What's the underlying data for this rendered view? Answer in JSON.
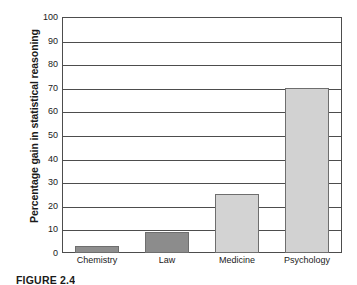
{
  "figure": {
    "caption": "FIGURE 2.4"
  },
  "chart_data": {
    "type": "bar",
    "title": "",
    "xlabel": "",
    "ylabel": "Percentage gain in statistical reasoning",
    "categories": [
      "Chemistry",
      "Law",
      "Medicine",
      "Psychology"
    ],
    "values": [
      3,
      9,
      25,
      70
    ],
    "series": [
      {
        "name": "Percentage gain in statistical reasoning",
        "values": [
          3,
          9,
          25,
          70
        ]
      }
    ],
    "ylim": [
      0,
      100
    ],
    "ytick_labels": [
      "100",
      "90",
      "80",
      "70",
      "60",
      "50",
      "40",
      "30",
      "20",
      "10",
      "0"
    ],
    "yticks": [
      100,
      90,
      80,
      70,
      60,
      50,
      40,
      30,
      20,
      10,
      0
    ],
    "ytick_interval": 10,
    "grid": true,
    "grid_orientation": "horizontal",
    "legend": false,
    "legend_position": "none",
    "bar_colors": [
      "#8e8e8e",
      "#8c8c8c",
      "#d3d3d3",
      "#d2d2d2"
    ],
    "bar_border_color": "#6e6e6e",
    "axis_color": "#4d4d4d",
    "background_color": "#ffffff"
  }
}
